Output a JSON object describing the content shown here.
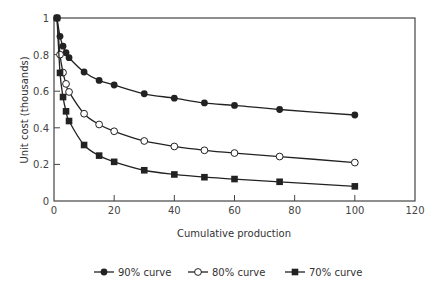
{
  "chart_data": {
    "type": "line",
    "title": "",
    "xlabel": "Cumulative production",
    "ylabel": "Unit cost (thousands)",
    "xlim": [
      0,
      120
    ],
    "ylim": [
      0,
      1
    ],
    "xticks": [
      0,
      20,
      40,
      60,
      80,
      100,
      120
    ],
    "yticks": [
      0,
      0.2,
      0.4,
      0.6,
      0.8,
      1
    ],
    "ytick_labels": [
      "0",
      "0.2",
      "0.4",
      "0.6",
      "0.8",
      "1"
    ],
    "grid": false,
    "legend_position": "bottom",
    "series": [
      {
        "name": "90% curve",
        "marker": "filled-circle",
        "x": [
          1,
          2,
          3,
          4,
          5,
          10,
          15,
          20,
          30,
          40,
          50,
          60,
          75,
          100
        ],
        "y": [
          1.0,
          0.9,
          0.846,
          0.81,
          0.783,
          0.705,
          0.659,
          0.634,
          0.586,
          0.562,
          0.536,
          0.522,
          0.5,
          0.47
        ]
      },
      {
        "name": "80% curve",
        "marker": "open-circle",
        "x": [
          1,
          2,
          3,
          4,
          5,
          10,
          15,
          20,
          30,
          40,
          50,
          60,
          75,
          100
        ],
        "y": [
          1.0,
          0.8,
          0.702,
          0.64,
          0.596,
          0.477,
          0.418,
          0.381,
          0.328,
          0.298,
          0.277,
          0.262,
          0.243,
          0.21
        ]
      },
      {
        "name": "70% curve",
        "marker": "filled-square",
        "x": [
          1,
          2,
          3,
          4,
          5,
          10,
          15,
          20,
          30,
          40,
          50,
          60,
          75,
          100
        ],
        "y": [
          1.0,
          0.7,
          0.568,
          0.49,
          0.437,
          0.306,
          0.248,
          0.214,
          0.168,
          0.145,
          0.13,
          0.12,
          0.105,
          0.08
        ]
      }
    ]
  },
  "legend": {
    "items": [
      {
        "label": "90% curve",
        "marker": "filled-circle"
      },
      {
        "label": "80% curve",
        "marker": "open-circle"
      },
      {
        "label": "70% curve",
        "marker": "filled-square"
      }
    ]
  },
  "colors": {
    "line": "#222222",
    "axis": "#444444",
    "text": "#333333"
  }
}
